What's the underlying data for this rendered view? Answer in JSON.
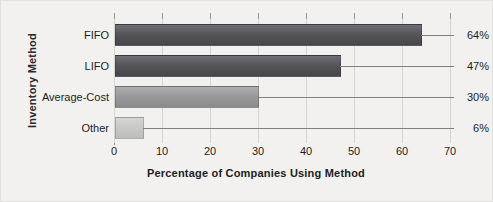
{
  "chart_data": {
    "type": "bar",
    "orientation": "horizontal",
    "title": "",
    "xlabel": "Percentage of Companies Using Method",
    "ylabel": "Inventory Method",
    "categories": [
      "FIFO",
      "LIFO",
      "Average-Cost",
      "Other"
    ],
    "values": [
      64,
      47,
      30,
      6
    ],
    "value_labels": [
      "64%",
      "47%",
      "30%",
      "6%"
    ],
    "xlim": [
      0,
      70
    ],
    "xticks": [
      0,
      10,
      20,
      30,
      40,
      50,
      60,
      70
    ],
    "xtick_labels": [
      "0",
      "10",
      "20",
      "30",
      "40",
      "50",
      "60",
      "70"
    ],
    "grid": true,
    "grid_axis": "x",
    "legend": false,
    "bar_colors": [
      "#55555a",
      "#55555a",
      "#9a9a9c",
      "#c9c9c8"
    ],
    "bar_colors_top": [
      "#6f6f76",
      "#6f6f76",
      "#aeaeb0",
      "#d6d6d5"
    ],
    "bar_colors_bottom": [
      "#45454b",
      "#45454b",
      "#8b8b8e",
      "#bdbdbc"
    ],
    "background_color": "#f2f1ef",
    "gridline_color": "#d6d5d1",
    "axis_color": "#8d8d8d",
    "leader_line_color": "#7f7f7b",
    "text_color": "#1d1d1d"
  }
}
